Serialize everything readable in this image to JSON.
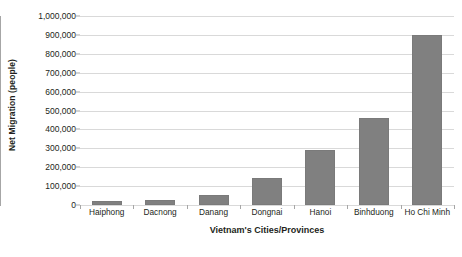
{
  "chart_data": {
    "type": "bar",
    "title": "",
    "xlabel": "Vietnam's Cities/Provinces",
    "ylabel": "Net Migration (people)",
    "categories": [
      "Haiphong",
      "Dacnong",
      "Danang",
      "Dongnai",
      "Hanoi",
      "Binhduong",
      "Ho Chi Minh"
    ],
    "values": [
      20000,
      28000,
      55000,
      145000,
      290000,
      460000,
      900000
    ],
    "ylim": [
      0,
      1000000
    ],
    "yticks": [
      0,
      100000,
      200000,
      300000,
      400000,
      500000,
      600000,
      700000,
      800000,
      900000,
      1000000
    ],
    "ytick_labels": [
      "0",
      "100,000",
      "200,000",
      "300,000",
      "400,000",
      "500,000",
      "600,000",
      "700,000",
      "800,000",
      "900,000",
      "1,000,000"
    ],
    "grid": true,
    "legend": null,
    "series": [
      {
        "name": "Net Migration",
        "values": [
          20000,
          28000,
          55000,
          145000,
          290000,
          460000,
          900000
        ],
        "color": "#808080"
      }
    ],
    "colors": {
      "bar": "#808080",
      "bar_border": "#7a7a7a",
      "gridline": "#d9d9d9",
      "axis": "#a6a6a6",
      "text": "#231f20",
      "background": "#ffffff"
    }
  }
}
